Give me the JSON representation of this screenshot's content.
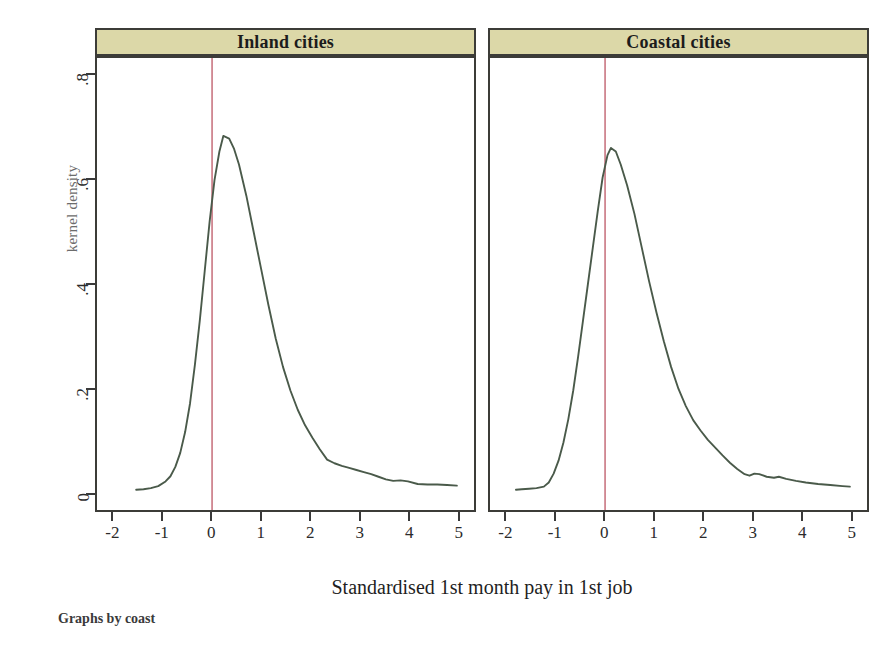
{
  "figure": {
    "y_axis_title": "kernel density",
    "x_axis_title": "Standardised 1st month pay in 1st job",
    "footnote": "Graphs by coast",
    "curve_color": "#4a5a4a",
    "refline_color": "#c0606e",
    "header_fill": "#dcd8a8",
    "border_color": "#3c3c38"
  },
  "chart_data": {
    "type": "line",
    "title": "",
    "subtitle": "",
    "xlabel": "Standardised 1st month pay in 1st job",
    "ylabel": "kernel density",
    "xlim": [
      -2.35,
      5.35
    ],
    "ylim": [
      -0.035,
      0.835
    ],
    "xticks": [
      -2,
      -1,
      0,
      1,
      2,
      3,
      4,
      5
    ],
    "xticklabels": [
      "-2",
      "-1",
      "0",
      "1",
      "2",
      "3",
      "4",
      "5"
    ],
    "yticks": [
      0,
      0.2,
      0.4,
      0.6,
      0.8
    ],
    "yticklabels": [
      "0",
      ".2",
      ".4",
      ".6",
      ".8"
    ],
    "grid": false,
    "legend": "none",
    "annotations": [
      {
        "kind": "vertical-reference-line",
        "x": 0,
        "color": "#c0606e",
        "panels": [
          "Inland cities",
          "Coastal cities"
        ]
      }
    ],
    "panels": [
      {
        "label": "Inland cities",
        "peak_x": 0.23,
        "peak_y": 0.685,
        "x": [
          -1.55,
          -1.4,
          -1.25,
          -1.1,
          -0.95,
          -0.85,
          -0.75,
          -0.65,
          -0.55,
          -0.45,
          -0.35,
          -0.25,
          -0.15,
          -0.05,
          0.05,
          0.15,
          0.23,
          0.35,
          0.45,
          0.55,
          0.7,
          0.85,
          1.0,
          1.15,
          1.3,
          1.45,
          1.6,
          1.75,
          1.9,
          2.05,
          2.2,
          2.35,
          2.5,
          2.65,
          2.8,
          2.95,
          3.1,
          3.25,
          3.4,
          3.55,
          3.7,
          3.85,
          4.0,
          4.2,
          4.4,
          4.6,
          4.8,
          5.0
        ],
        "y": [
          0.004,
          0.005,
          0.007,
          0.011,
          0.02,
          0.03,
          0.048,
          0.075,
          0.115,
          0.17,
          0.245,
          0.33,
          0.425,
          0.52,
          0.6,
          0.655,
          0.685,
          0.68,
          0.66,
          0.63,
          0.57,
          0.5,
          0.43,
          0.36,
          0.295,
          0.24,
          0.195,
          0.158,
          0.128,
          0.104,
          0.082,
          0.062,
          0.055,
          0.05,
          0.046,
          0.042,
          0.038,
          0.034,
          0.029,
          0.024,
          0.021,
          0.022,
          0.02,
          0.015,
          0.014,
          0.014,
          0.013,
          0.012
        ]
      },
      {
        "label": "Coastal cities",
        "peak_x": 0.12,
        "peak_y": 0.662,
        "x": [
          -1.82,
          -1.7,
          -1.55,
          -1.4,
          -1.25,
          -1.15,
          -1.05,
          -0.95,
          -0.85,
          -0.75,
          -0.65,
          -0.55,
          -0.45,
          -0.35,
          -0.25,
          -0.15,
          -0.05,
          0.05,
          0.12,
          0.22,
          0.32,
          0.45,
          0.6,
          0.75,
          0.9,
          1.05,
          1.2,
          1.35,
          1.5,
          1.65,
          1.8,
          1.95,
          2.1,
          2.25,
          2.4,
          2.55,
          2.7,
          2.85,
          2.95,
          3.05,
          3.15,
          3.3,
          3.45,
          3.55,
          3.7,
          3.9,
          4.1,
          4.35,
          4.6,
          4.85,
          5.0
        ],
        "y": [
          0.004,
          0.005,
          0.006,
          0.007,
          0.01,
          0.018,
          0.035,
          0.06,
          0.095,
          0.14,
          0.195,
          0.26,
          0.33,
          0.4,
          0.47,
          0.54,
          0.605,
          0.648,
          0.662,
          0.655,
          0.63,
          0.59,
          0.535,
          0.47,
          0.405,
          0.345,
          0.29,
          0.24,
          0.198,
          0.165,
          0.138,
          0.118,
          0.1,
          0.085,
          0.07,
          0.056,
          0.044,
          0.034,
          0.031,
          0.035,
          0.034,
          0.029,
          0.027,
          0.029,
          0.025,
          0.021,
          0.018,
          0.015,
          0.013,
          0.011,
          0.01
        ]
      }
    ]
  }
}
